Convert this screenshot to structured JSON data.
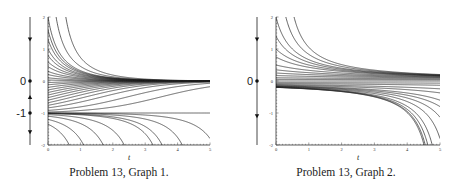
{
  "chart_data": [
    {
      "type": "line",
      "title": "Problem 13, Graph 1.",
      "xlabel": "t",
      "ylabel": "",
      "xlim": [
        0,
        5
      ],
      "ylim": [
        -2,
        2
      ],
      "x_ticks": [
        "0",
        "1",
        "2",
        "3",
        "4",
        "5"
      ],
      "y_ticks": [
        "-2",
        "-1",
        "0",
        "1",
        "2"
      ],
      "grid": false,
      "equation_model": "dy/dt = -y(y+1)",
      "equilibria": [
        0,
        -1
      ],
      "initial_values": [
        2.0,
        1.6,
        1.3,
        1.0,
        0.8,
        0.6,
        0.45,
        0.3,
        0.2,
        0.1,
        0.03,
        -0.05,
        -0.12,
        -0.2,
        -0.28,
        -0.36,
        -0.44,
        -0.52,
        -0.6,
        -0.68,
        -0.76,
        -0.84,
        -0.92,
        -0.97,
        -1.0,
        -1.02,
        -1.05,
        -1.1,
        -1.2,
        -1.35
      ],
      "extra_starts_above": [
        {
          "t0": 0.25,
          "y0": 2
        },
        {
          "t0": 0.55,
          "y0": 2
        }
      ],
      "phase_line": {
        "labels": [
          "0",
          "-1"
        ],
        "equilibrium_values": [
          0,
          -1
        ],
        "arrows": [
          {
            "y": 1.3,
            "dir": "down"
          },
          {
            "y": -0.5,
            "dir": "up"
          },
          {
            "y": -1.6,
            "dir": "down"
          }
        ]
      }
    },
    {
      "type": "line",
      "title": "Problem 13, Graph 2.",
      "xlabel": "t",
      "ylabel": "",
      "xlim": [
        0,
        5
      ],
      "ylim": [
        -2,
        2
      ],
      "x_ticks": [
        "0",
        "1",
        "2",
        "3",
        "4",
        "5"
      ],
      "y_ticks": [
        "-2",
        "-1",
        "0",
        "1",
        "2"
      ],
      "grid": false,
      "equation_model": "dy/dt = -y^2",
      "equilibria": [
        0
      ],
      "initial_values": [
        2.0,
        1.4,
        1.0,
        0.75,
        0.5,
        0.35,
        0.25,
        0.17,
        0.1,
        0.05,
        0.0,
        -0.05,
        -0.08,
        -0.11,
        -0.13,
        -0.15,
        -0.16,
        -0.17,
        -0.18,
        -0.19,
        -0.195
      ],
      "extra_starts_above": [
        {
          "t0": 0.3,
          "y0": 2
        },
        {
          "t0": 0.55,
          "y0": 2
        }
      ],
      "phase_line": {
        "labels": [
          "0"
        ],
        "equilibrium_values": [
          0
        ],
        "arrows": [
          {
            "y": 1.3,
            "dir": "down"
          },
          {
            "y": -1.1,
            "dir": "down"
          }
        ]
      }
    }
  ],
  "captions": [
    "Problem 13, Graph 1.",
    "Problem 13, Graph 2."
  ],
  "axis_label": "t"
}
